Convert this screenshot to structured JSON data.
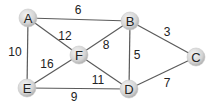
{
  "graph": {
    "type": "weighted-undirected",
    "nodes": [
      {
        "id": "A",
        "label": "A",
        "x": 28,
        "y": 18
      },
      {
        "id": "B",
        "label": "B",
        "x": 130,
        "y": 21
      },
      {
        "id": "C",
        "label": "C",
        "x": 196,
        "y": 57
      },
      {
        "id": "D",
        "label": "D",
        "x": 129,
        "y": 89
      },
      {
        "id": "E",
        "label": "E",
        "x": 27,
        "y": 88
      },
      {
        "id": "F",
        "label": "F",
        "x": 79,
        "y": 55
      }
    ],
    "edges": [
      {
        "from": "A",
        "to": "B",
        "weight": "6",
        "lx": 78,
        "ly": 10
      },
      {
        "from": "A",
        "to": "F",
        "weight": "12",
        "lx": 65,
        "ly": 36
      },
      {
        "from": "A",
        "to": "E",
        "weight": "10",
        "lx": 15,
        "ly": 52
      },
      {
        "from": "F",
        "to": "E",
        "weight": "16",
        "lx": 47,
        "ly": 64
      },
      {
        "from": "F",
        "to": "B",
        "weight": "8",
        "lx": 106,
        "ly": 45
      },
      {
        "from": "B",
        "to": "D",
        "weight": "5",
        "lx": 137,
        "ly": 55
      },
      {
        "from": "F",
        "to": "D",
        "weight": "11",
        "lx": 98,
        "ly": 80
      },
      {
        "from": "E",
        "to": "D",
        "weight": "9",
        "lx": 74,
        "ly": 97
      },
      {
        "from": "B",
        "to": "C",
        "weight": "3",
        "lx": 167,
        "ly": 32
      },
      {
        "from": "D",
        "to": "C",
        "weight": "7",
        "lx": 167,
        "ly": 83
      }
    ],
    "style": {
      "edge_color": "#5a5a5a",
      "node_fill_light": "#f2f2f2",
      "node_fill_dark": "#b8b8b8",
      "text_color": "#222222",
      "node_radius": 9
    }
  }
}
